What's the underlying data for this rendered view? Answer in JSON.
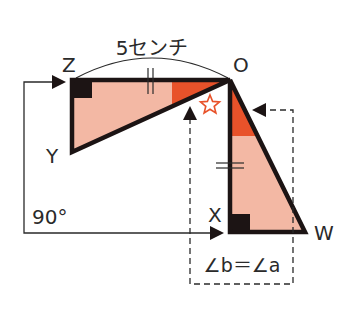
{
  "diagram": {
    "type": "geometry-rotation",
    "length_label": "5センチ",
    "rotation_label": "90°",
    "equality_label": "∠b＝∠a",
    "points": {
      "Z": {
        "label": "Z",
        "x": 72,
        "y": 80
      },
      "O": {
        "label": "O",
        "x": 230,
        "y": 80
      },
      "Y": {
        "label": "Y",
        "x": 72,
        "y": 152
      },
      "X": {
        "label": "X",
        "x": 230,
        "y": 232
      },
      "W": {
        "label": "W",
        "x": 305,
        "y": 232
      }
    },
    "triangles": [
      {
        "name": "ZOY",
        "vertices": [
          "Z",
          "O",
          "Y"
        ],
        "right_angle_at": "Z"
      },
      {
        "name": "OXW",
        "vertices": [
          "O",
          "X",
          "W"
        ],
        "right_angle_at": "X"
      }
    ],
    "marks": {
      "segment_ZO": "||",
      "segment_OX": "=",
      "star_symbol": "☆"
    },
    "colors": {
      "fill_light": "#f3b8a4",
      "fill_angle": "#e8522a",
      "stroke": "#1c1414",
      "star": "#e8522a",
      "text": "#2a2a2a"
    }
  }
}
